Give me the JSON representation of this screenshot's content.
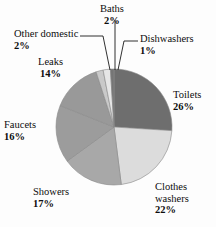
{
  "chart_data": {
    "type": "pie",
    "title": "",
    "subtitle": "",
    "xlabel": "",
    "ylabel": "",
    "legend_position": "none",
    "grid": false,
    "units": "percent",
    "total": 100,
    "categories": [
      "Toilets",
      "Clothes washers",
      "Showers",
      "Faucets",
      "Leaks",
      "Other domestic",
      "Baths",
      "Dishwashers"
    ],
    "values": [
      26,
      22,
      17,
      16,
      14,
      2,
      2,
      1
    ],
    "slices": [
      {
        "label": "Toilets",
        "value": 26,
        "value_text": "26%",
        "color": "#6e6e6e",
        "start_deg": 0,
        "sweep_deg": 93.6
      },
      {
        "label": "Clothes washers",
        "value": 22,
        "value_text": "22%",
        "color": "#dcdcdc",
        "start_deg": 93.6,
        "sweep_deg": 79.2
      },
      {
        "label": "Showers",
        "value": 17,
        "value_text": "17%",
        "color": "#a8a8a8",
        "start_deg": 172.8,
        "sweep_deg": 61.2
      },
      {
        "label": "Faucets",
        "value": 16,
        "value_text": "16%",
        "color": "#9c9c9c",
        "start_deg": 234.0,
        "sweep_deg": 57.6
      },
      {
        "label": "Leaks",
        "value": 14,
        "value_text": "14%",
        "color": "#999999",
        "start_deg": 291.6,
        "sweep_deg": 50.4
      },
      {
        "label": "Other domestic",
        "value": 2,
        "value_text": "2%",
        "color": "#c9c9c9",
        "start_deg": 342.0,
        "sweep_deg": 7.2
      },
      {
        "label": "Baths",
        "value": 2,
        "value_text": "2%",
        "color": "#e6e6e6",
        "start_deg": 349.2,
        "sweep_deg": 7.2
      },
      {
        "label": "Dishwashers",
        "value": 1,
        "value_text": "1%",
        "color": "#757575",
        "start_deg": 356.4,
        "sweep_deg": 3.6
      }
    ]
  },
  "labels": {
    "baths": {
      "name": "Baths",
      "pct": "2%"
    },
    "dishwashers": {
      "name": "Dishwashers",
      "pct": "1%"
    },
    "other_domestic": {
      "name": "Other domestic",
      "pct": "2%"
    },
    "leaks": {
      "name": "Leaks",
      "pct": "14%"
    },
    "toilets": {
      "name": "Toilets",
      "pct": "26%"
    },
    "faucets": {
      "name": "Faucets",
      "pct": "16%"
    },
    "showers": {
      "name": "Showers",
      "pct": "17%"
    },
    "clothes_washers": {
      "name": "Clothes",
      "name2": "washers",
      "pct": "22%"
    }
  },
  "style": {
    "background": "#fdfdfd",
    "text_color": "#0d0d0d",
    "leader_line_color": "#1a1a1a",
    "slice_edge_color": "#8a8a8a"
  }
}
